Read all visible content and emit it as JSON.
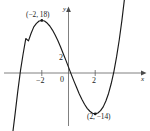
{
  "figure": {
    "partial_tag": ")",
    "axis_labels": {
      "x": "x",
      "y": "y"
    },
    "origin_label": "0",
    "y_intercept_label": "2",
    "tick_labels": {
      "negative_two": "−2",
      "positive_two": "2"
    },
    "annotations": {
      "local_max": "(−2, 18)",
      "local_min": "(2, −14)"
    },
    "colors": {
      "curve": "#1a1a1a",
      "axis": "#555555",
      "text": "#222222",
      "background": "#ffffff"
    }
  },
  "chart_data": {
    "type": "line",
    "title": "",
    "xlabel": "x",
    "ylabel": "y",
    "grid": false,
    "legend": "none",
    "xlim": [
      -5.2,
      5.8
    ],
    "ylim": [
      -26,
      34
    ],
    "xticks": [
      -2,
      2
    ],
    "xticklabels": [
      "−2",
      "2"
    ],
    "yticks": [
      2
    ],
    "yticklabels": [
      "2"
    ],
    "function": "f(x) = x^3 - 12x + 2",
    "annotations": [
      {
        "label": "(−2, 18)",
        "x": -2,
        "y": 18,
        "kind": "local maximum",
        "marker": "dot"
      },
      {
        "label": "(2, −14)",
        "x": 2,
        "y": -14,
        "kind": "local minimum",
        "marker": "dot"
      }
    ],
    "x": [
      -5.2,
      -5.0,
      -4.8,
      -4.6,
      -4.4,
      -4.2,
      -4.0,
      -3.8,
      -3.6,
      -3.4,
      -3.2,
      -3.0,
      -2.8,
      -2.6,
      -2.4,
      -2.2,
      -2.0,
      -1.8,
      -1.6,
      -1.4,
      -1.2,
      -1.0,
      -0.8,
      -0.6,
      -0.4,
      -0.2,
      0.0,
      0.2,
      0.4,
      0.6,
      0.8,
      1.0,
      1.2,
      1.4,
      1.6,
      1.8,
      2.0,
      2.2,
      2.4,
      2.6,
      2.8,
      3.0,
      3.2,
      3.4,
      3.6,
      3.8,
      4.0,
      4.2,
      4.4
    ],
    "y": [
      -76.0,
      -63.0,
      -51.2,
      -40.3,
      -30.4,
      -21.4,
      -14.0,
      -6.3,
      0.7,
      6.5,
      11.8,
      11.0,
      13.6,
      15.8,
      17.0,
      17.8,
      18.0,
      17.8,
      17.1,
      16.1,
      14.7,
      13.0,
      11.1,
      9.0,
      6.7,
      4.4,
      2.0,
      -0.4,
      -2.7,
      -4.9,
      -7.1,
      -9.0,
      -10.7,
      -12.1,
      -13.1,
      -13.8,
      -14.0,
      -13.7,
      -12.9,
      -11.6,
      -9.6,
      -7.0,
      -3.6,
      0.5,
      5.5,
      11.3,
      18.0,
      25.7,
      34.4
    ]
  }
}
